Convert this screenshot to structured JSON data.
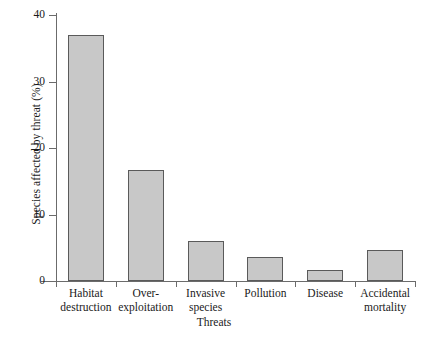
{
  "chart_data": {
    "type": "bar",
    "title": "",
    "xlabel": "Threats",
    "ylabel": "Species affected by threat (%)",
    "categories": [
      "Habitat destruction",
      "Over-exploitation",
      "Invasive species",
      "Pollution",
      "Disease",
      "Accidental mortality"
    ],
    "category_lines": [
      [
        "Habitat",
        "destruction"
      ],
      [
        "Over-",
        "exploitation"
      ],
      [
        "Invasive",
        "species"
      ],
      [
        "Pollution",
        ""
      ],
      [
        "Disease",
        ""
      ],
      [
        "Accidental",
        "mortality"
      ]
    ],
    "values": [
      37,
      16.7,
      6,
      3.6,
      1.6,
      4.7
    ],
    "ylim": [
      0,
      40
    ],
    "yticks": [
      0,
      10,
      20,
      30,
      40
    ],
    "ytick_labels": [
      "0",
      "10",
      "20",
      "30",
      "40"
    ],
    "grid": false,
    "legend": "none",
    "bar_fill": "#c8c8c8",
    "bar_edge": "#5a5a5a",
    "axis_color": "#6b6b6b",
    "background": "#ffffff"
  }
}
